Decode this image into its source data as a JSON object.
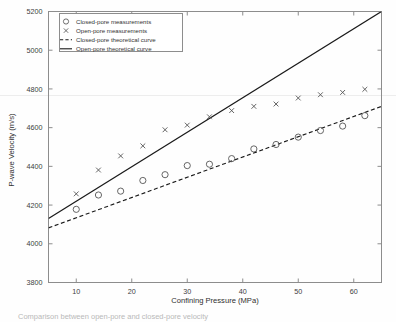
{
  "figure": {
    "background": "#fefefe",
    "frame_color": "#8d8d8d",
    "caption_partial": "Comparison between open-pore and closed-pore velocity"
  },
  "chart_data": {
    "type": "scatter",
    "title": "",
    "xlabel": "Confining Pressure (MPa)",
    "ylabel": "P-wave Velocity (m/s)",
    "xlim": [
      5,
      65
    ],
    "ylim": [
      3800,
      5200
    ],
    "xticks": [
      10,
      20,
      30,
      40,
      50,
      60
    ],
    "yticks": [
      3800,
      4000,
      4200,
      4400,
      4600,
      4800,
      5000,
      5200
    ],
    "xticklabels": [
      "10",
      "20",
      "30",
      "40",
      "50",
      "60"
    ],
    "yticklabels": [
      "3800",
      "4000",
      "4200",
      "4400",
      "4600",
      "4800",
      "5000",
      "5200"
    ],
    "grid": false,
    "legend_position": "upper left",
    "series": [
      {
        "name": "Closed-pore measurements",
        "marker": "circle",
        "style": "markers",
        "color": "#555555",
        "x": [
          10,
          14,
          18,
          22,
          26,
          30,
          34,
          38,
          42,
          46,
          50,
          54,
          58,
          62
        ],
        "y": [
          4178,
          4252,
          4272,
          4327,
          4357,
          4404,
          4411,
          4440,
          4490,
          4513,
          4551,
          4585,
          4608,
          4662
        ]
      },
      {
        "name": "Open-pore measurements",
        "marker": "x",
        "style": "markers",
        "color": "#555555",
        "x": [
          10,
          14,
          18,
          22,
          26,
          30,
          34,
          38,
          42,
          46,
          50,
          54,
          58,
          62
        ],
        "y": [
          4258,
          4381,
          4454,
          4506,
          4589,
          4613,
          4656,
          4688,
          4710,
          4722,
          4753,
          4770,
          4782,
          4798
        ]
      },
      {
        "name": "Closed-pore theoretical curve",
        "marker": "none",
        "style": "dashed-line",
        "color": "#1a1a1a",
        "x": [
          5,
          65
        ],
        "y": [
          4082,
          4710
        ]
      },
      {
        "name": "Open-pore theoretical curve",
        "marker": "none",
        "style": "solid-line",
        "color": "#1a1a1a",
        "x": [
          5,
          65
        ],
        "y": [
          4131,
          5200
        ]
      }
    ],
    "legend_entries": [
      {
        "label": "Closed-pore measurements",
        "glyph": "circle"
      },
      {
        "label": "Open-pore measurements",
        "glyph": "x"
      },
      {
        "label": "Closed-pore theoretical curve",
        "glyph": "dashed"
      },
      {
        "label": "Open-pore theoretical curve",
        "glyph": "solid"
      }
    ]
  }
}
